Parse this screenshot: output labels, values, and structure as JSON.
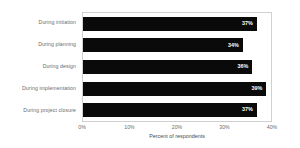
{
  "chart_data": {
    "type": "bar",
    "orientation": "horizontal",
    "title": "",
    "xlabel": "Percent of respondents",
    "ylabel": "",
    "xlim": [
      0,
      40
    ],
    "xticks": [
      "0%",
      "10%",
      "20%",
      "30%",
      "40%"
    ],
    "xtick_values": [
      0,
      10,
      20,
      30,
      40
    ],
    "grid": false,
    "legend": null,
    "categories": [
      "During initiation",
      "During planning",
      "During design",
      "During implementation",
      "During project closure"
    ],
    "values": [
      37,
      34,
      36,
      39,
      37
    ],
    "value_labels": [
      "37%",
      "34%",
      "36%",
      "39%",
      "37%"
    ],
    "bar_color": "#0a0a0a",
    "value_label_color": "#ffffff",
    "axis_text_color": "#6b6b6b",
    "plot_border_color": "#d0d0d0",
    "background_color": "#ffffff"
  }
}
